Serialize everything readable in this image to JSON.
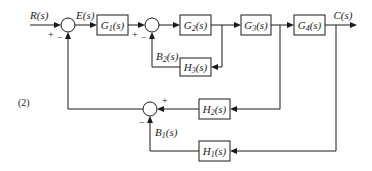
{
  "diagram": {
    "problem_number": "(2)",
    "signals": {
      "input": "R(s)",
      "error": "E(s)",
      "output": "C(s)",
      "feedback_b2": "B2(s)",
      "feedback_b1": "B1(s)"
    },
    "blocks": {
      "g1": "G1(s)",
      "g2": "G2(s)",
      "g3": "G3(s)",
      "g4": "G4(s)",
      "h1": "H1(s)",
      "h2": "H2(s)",
      "h3": "H3(s)"
    },
    "signs": {
      "sum1_input": "+",
      "sum1_feedback": "−",
      "sum2_input": "+",
      "sum2_feedback": "−",
      "sum3_h2": "+",
      "sum3_h1": "−"
    },
    "colors": {
      "line": "#1a1a1a",
      "background": "#ffffff"
    }
  }
}
